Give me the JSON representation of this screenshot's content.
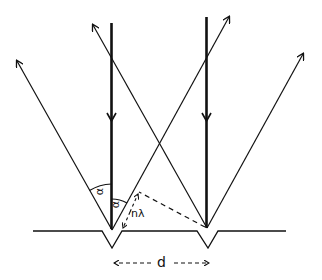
{
  "diagram": {
    "labels": {
      "alpha_outer": "α",
      "alpha_inner": "α",
      "path_difference": "nλ",
      "spacing": "d"
    },
    "colors": {
      "stroke": "#111111",
      "background": "#ffffff"
    },
    "elements": [
      "grating-surface",
      "groove-left",
      "groove-right",
      "incident-ray-left",
      "incident-ray-right",
      "diffracted-ray-left-outer",
      "diffracted-ray-left-inner",
      "diffracted-ray-right-inner",
      "diffracted-ray-right-outer",
      "angle-arc-outer",
      "angle-arc-inner",
      "path-difference-dashed",
      "wavefront-dashed",
      "spacing-arrow"
    ]
  }
}
